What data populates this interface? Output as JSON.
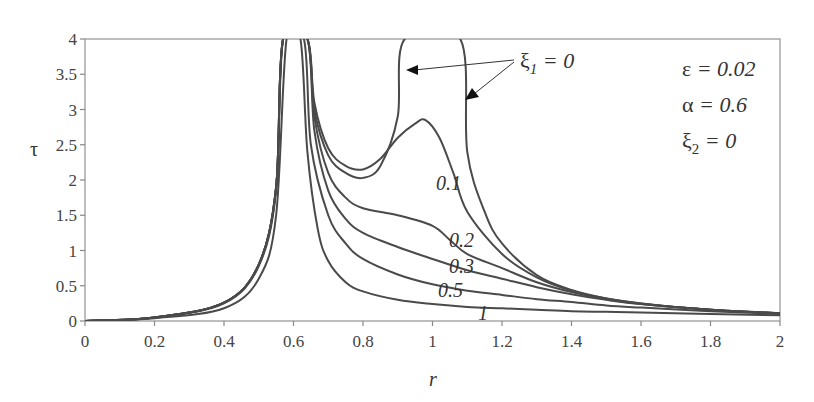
{
  "chart_data": {
    "type": "line",
    "title": "",
    "xlabel": "r",
    "ylabel": "τ",
    "xlim": [
      0,
      2
    ],
    "ylim": [
      0,
      4
    ],
    "grid": false,
    "x_ticks": [
      "0",
      "0.2",
      "0.4",
      "0.6",
      "0.8",
      "1",
      "1.2",
      "1.4",
      "1.6",
      "1.8",
      "2"
    ],
    "y_ticks": [
      "0",
      "0.5",
      "1",
      "1.5",
      "2",
      "2.5",
      "3",
      "3.5",
      "4"
    ],
    "parameters": [
      {
        "symbol": "ε",
        "sub": "",
        "value": "0.02"
      },
      {
        "symbol": "α",
        "sub": "",
        "value": "0.6"
      },
      {
        "symbol": "ξ",
        "sub": "2",
        "value": "0"
      }
    ],
    "annotation": {
      "symbol": "ξ",
      "sub": "1",
      "text": "= 0",
      "arrows": 2
    },
    "series": [
      {
        "name": "ξ1 = 0",
        "label": "",
        "x": [
          0,
          0.2,
          0.4,
          0.5,
          0.55,
          0.57,
          0.64,
          0.66,
          0.7,
          0.75,
          0.8,
          0.85,
          0.9,
          0.92,
          1.08,
          1.1,
          1.15,
          1.2,
          1.3,
          1.4,
          1.5,
          1.6,
          1.8,
          2.0
        ],
        "y": [
          0,
          0.05,
          0.26,
          0.8,
          1.9,
          4.0,
          4.0,
          3.0,
          2.35,
          2.1,
          2.03,
          2.2,
          2.9,
          4.0,
          4.0,
          2.4,
          1.55,
          1.1,
          0.65,
          0.44,
          0.32,
          0.25,
          0.16,
          0.11
        ]
      },
      {
        "name": "ξ1 = 0.1",
        "label": "0.1",
        "x": [
          0,
          0.2,
          0.4,
          0.5,
          0.55,
          0.57,
          0.64,
          0.66,
          0.7,
          0.75,
          0.8,
          0.85,
          0.9,
          0.95,
          0.98,
          1.02,
          1.06,
          1.1,
          1.2,
          1.3,
          1.4,
          1.5,
          1.6,
          1.8,
          2.0
        ],
        "y": [
          0,
          0.05,
          0.26,
          0.8,
          1.9,
          4.0,
          4.0,
          3.1,
          2.45,
          2.2,
          2.15,
          2.3,
          2.6,
          2.8,
          2.85,
          2.6,
          2.1,
          1.55,
          0.95,
          0.62,
          0.43,
          0.32,
          0.25,
          0.16,
          0.11
        ]
      },
      {
        "name": "ξ1 = 0.2",
        "label": "0.2",
        "x": [
          0,
          0.2,
          0.4,
          0.5,
          0.55,
          0.57,
          0.64,
          0.66,
          0.7,
          0.75,
          0.8,
          0.9,
          1.0,
          1.05,
          1.1,
          1.2,
          1.3,
          1.4,
          1.5,
          1.6,
          1.8,
          2.0
        ],
        "y": [
          0,
          0.05,
          0.26,
          0.8,
          1.9,
          4.0,
          4.0,
          2.9,
          2.1,
          1.75,
          1.6,
          1.5,
          1.35,
          1.15,
          0.95,
          0.75,
          0.55,
          0.41,
          0.31,
          0.24,
          0.16,
          0.11
        ]
      },
      {
        "name": "ξ1 = 0.3",
        "label": "0.3",
        "x": [
          0,
          0.2,
          0.4,
          0.5,
          0.55,
          0.57,
          0.64,
          0.66,
          0.7,
          0.75,
          0.8,
          0.9,
          1.0,
          1.1,
          1.2,
          1.3,
          1.4,
          1.5,
          1.6,
          1.8,
          2.0
        ],
        "y": [
          0,
          0.05,
          0.26,
          0.8,
          1.9,
          4.0,
          4.0,
          2.7,
          1.85,
          1.45,
          1.25,
          1.05,
          0.88,
          0.72,
          0.6,
          0.48,
          0.38,
          0.3,
          0.24,
          0.16,
          0.11
        ]
      },
      {
        "name": "ξ1 = 0.5",
        "label": "0.5",
        "x": [
          0,
          0.2,
          0.4,
          0.5,
          0.55,
          0.57,
          0.63,
          0.65,
          0.7,
          0.75,
          0.8,
          0.9,
          1.0,
          1.1,
          1.2,
          1.3,
          1.4,
          1.5,
          1.6,
          1.8,
          2.0
        ],
        "y": [
          0,
          0.05,
          0.25,
          0.78,
          1.85,
          4.0,
          4.0,
          2.5,
          1.5,
          1.1,
          0.88,
          0.66,
          0.52,
          0.43,
          0.37,
          0.31,
          0.27,
          0.22,
          0.19,
          0.14,
          0.1
        ]
      },
      {
        "name": "ξ1 = 1",
        "label": "1",
        "x": [
          0,
          0.2,
          0.4,
          0.5,
          0.55,
          0.58,
          0.62,
          0.64,
          0.67,
          0.7,
          0.75,
          0.8,
          0.9,
          1.0,
          1.1,
          1.2,
          1.3,
          1.4,
          1.5,
          1.6,
          1.8,
          2.0
        ],
        "y": [
          0,
          0.04,
          0.18,
          0.6,
          1.5,
          4.0,
          4.0,
          2.4,
          1.3,
          0.85,
          0.55,
          0.42,
          0.3,
          0.24,
          0.2,
          0.18,
          0.16,
          0.14,
          0.13,
          0.12,
          0.1,
          0.08
        ]
      }
    ]
  }
}
